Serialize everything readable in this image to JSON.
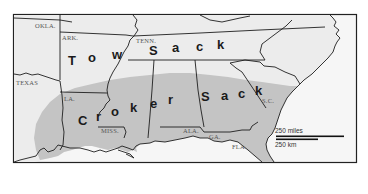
{
  "map": {
    "colors": {
      "background": "#ffffff",
      "land_unshaded": "#ececec",
      "land_shaded": "#c4c4c4",
      "water": "#f6f6f6",
      "border": "#1e1e1e",
      "frame": "#222222"
    },
    "state_labels": {
      "okla": "OKLA.",
      "ark": "ARK.",
      "tenn": "TENN.",
      "texas": "TEXAS",
      "la": "LA.",
      "miss": "MISS.",
      "ala": "ALA.",
      "ga": "GA.",
      "fla": "FLA.",
      "sc": "S.C."
    },
    "terms": {
      "tow_sack": {
        "letters": [
          "T",
          "o",
          "w",
          "S",
          "a",
          "c",
          "k"
        ]
      },
      "croker_sack": {
        "letters": [
          "C",
          "r",
          "o",
          "k",
          "e",
          "r",
          "S",
          "a",
          "c",
          "k"
        ]
      }
    },
    "scale": {
      "miles_label": "250 miles",
      "km_label": "250 km"
    }
  }
}
